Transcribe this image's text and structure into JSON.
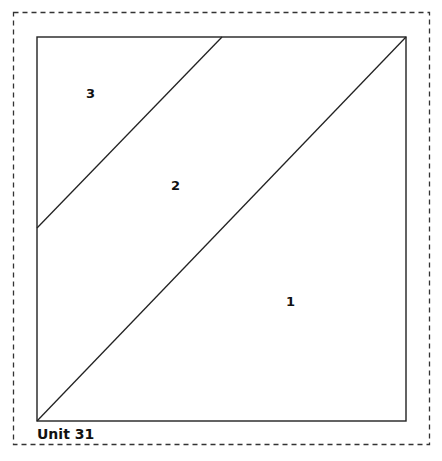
{
  "diagram": {
    "title": "Unit 31",
    "pieces": [
      {
        "id": "piece-1",
        "label": "1"
      },
      {
        "id": "piece-2",
        "label": "2"
      },
      {
        "id": "piece-3",
        "label": "3"
      }
    ],
    "colors": {
      "line": "#222222",
      "dash": "#333333",
      "background": "#ffffff"
    }
  }
}
